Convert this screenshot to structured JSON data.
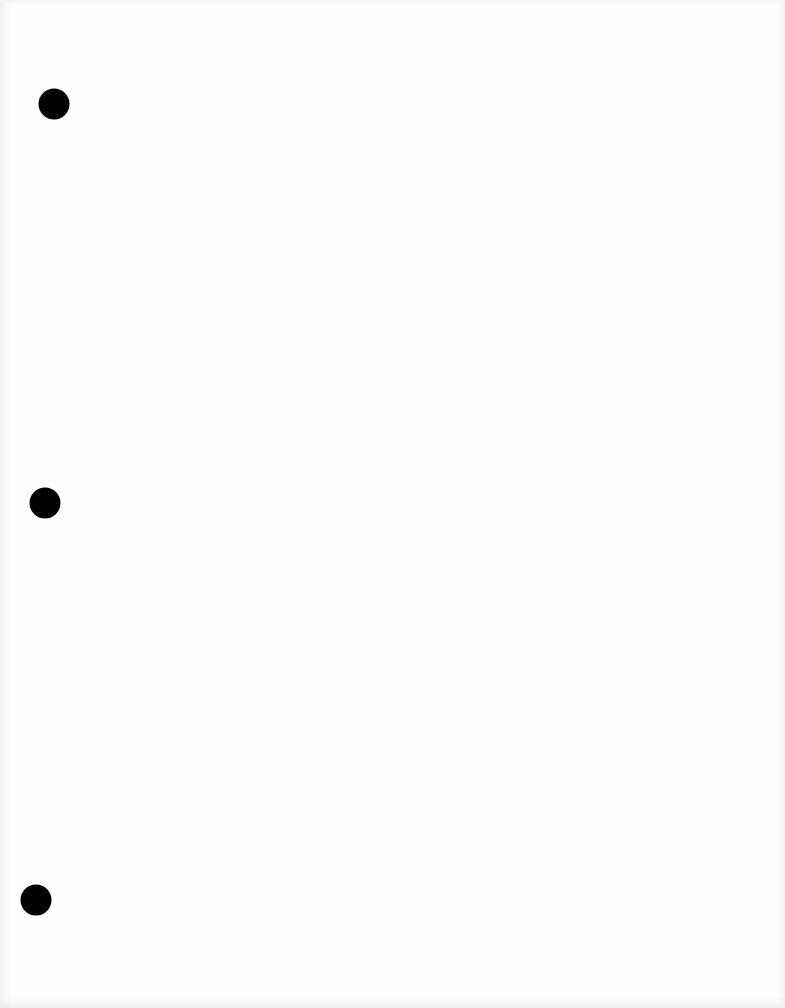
{
  "document": {
    "type": "blank scanned page",
    "background_color": "#fefefe",
    "punch_holes": [
      {
        "cx": 54,
        "cy": 104,
        "diameter": 31,
        "color": "#000000"
      },
      {
        "cx": 45,
        "cy": 503,
        "diameter": 31,
        "color": "#000000"
      },
      {
        "cx": 36,
        "cy": 900,
        "diameter": 31,
        "color": "#000000"
      }
    ]
  }
}
